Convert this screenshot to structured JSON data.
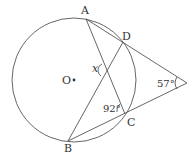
{
  "diagram": {
    "type": "geometry-circle-secants",
    "circle": {
      "center_label": "O",
      "cx": 74,
      "cy": 80,
      "r": 62
    },
    "points": {
      "A": {
        "label": "A",
        "x": 86,
        "y": 19
      },
      "D": {
        "label": "D",
        "x": 123,
        "y": 42
      },
      "C": {
        "label": "C",
        "x": 125,
        "y": 114
      },
      "B": {
        "label": "B",
        "x": 68,
        "y": 141
      },
      "P": {
        "label": "",
        "x": 187,
        "y": 83
      }
    },
    "angles": {
      "external": {
        "label": "57°"
      },
      "at_C": {
        "label": "92°"
      },
      "intersection": {
        "label": "x"
      }
    },
    "colors": {
      "stroke": "#555555",
      "text": "#333333"
    }
  }
}
